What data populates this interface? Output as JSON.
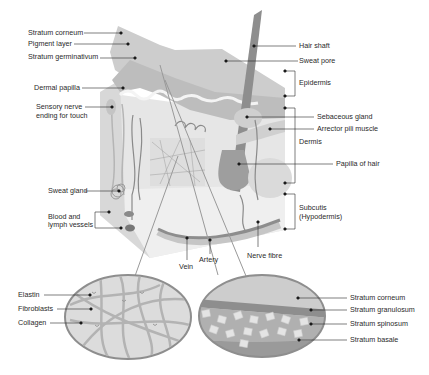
{
  "diagram": {
    "colors": {
      "background": "#ffffff",
      "epidermis_top": "#cfcfcf",
      "epidermis_mid": "#c2c2c2",
      "dermis": "#e3e3e3",
      "subcutis": "#eeeeee",
      "side_face": "#d9d9d9",
      "dark_structure": "#8a8a8a",
      "hair": "#8c8c8c",
      "leader_line": "#2a2a2a"
    },
    "labels_left": [
      {
        "text": "Stratum corneum"
      },
      {
        "text": "Pigment layer"
      },
      {
        "text": "Stratum germinativum"
      },
      {
        "text": "Dermal papilla"
      },
      {
        "text": "Sensory nerve"
      },
      {
        "text": "ending for touch"
      },
      {
        "text": "Sweat gland"
      },
      {
        "text": "Blood and"
      },
      {
        "text": "lymph vessels"
      }
    ],
    "labels_right": [
      {
        "text": "Hair shaft"
      },
      {
        "text": "Sweat pore"
      },
      {
        "text": "Epidermis"
      },
      {
        "text": "Sebaceous gland"
      },
      {
        "text": "Arrector pili muscle"
      },
      {
        "text": "Dermis"
      },
      {
        "text": "Papilla of hair"
      },
      {
        "text": "Subcutis"
      },
      {
        "text": "(Hypodermis)"
      }
    ],
    "labels_bottom": [
      {
        "text": "Vein"
      },
      {
        "text": "Artery"
      },
      {
        "text": "Nerve fibre"
      }
    ],
    "inset_left": {
      "description": "Dermis connective tissue detail",
      "labels": [
        {
          "text": "Elastin"
        },
        {
          "text": "Fibroblasts"
        },
        {
          "text": "Collagen"
        }
      ]
    },
    "inset_right": {
      "description": "Epidermis layers detail",
      "labels": [
        {
          "text": "Stratum corneum"
        },
        {
          "text": "Stratum granulosum"
        },
        {
          "text": "Stratum spinosum"
        },
        {
          "text": "Stratum basale"
        }
      ]
    }
  }
}
